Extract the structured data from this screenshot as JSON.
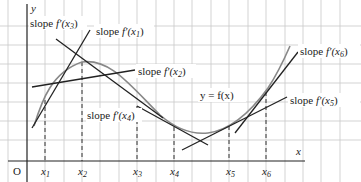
{
  "diagram": {
    "type": "tangent-slopes-of-curve",
    "axes": {
      "x_label": "x",
      "y_label": "y",
      "origin_label": "O"
    },
    "curve_label": "y = f(x)",
    "points": [
      {
        "id": "x1",
        "label_base": "x",
        "label_sub": "1"
      },
      {
        "id": "x2",
        "label_base": "x",
        "label_sub": "2"
      },
      {
        "id": "x3",
        "label_base": "x",
        "label_sub": "3"
      },
      {
        "id": "x4",
        "label_base": "x",
        "label_sub": "4"
      },
      {
        "id": "x5",
        "label_base": "x",
        "label_sub": "5"
      },
      {
        "id": "x6",
        "label_base": "x",
        "label_sub": "6"
      }
    ],
    "tangent_labels": {
      "x1": {
        "prefix": "slope ",
        "func": "f′(x",
        "sub": "1",
        "suffix": ")"
      },
      "x2": {
        "prefix": "slope ",
        "func": "f′(x",
        "sub": "2",
        "suffix": ")"
      },
      "x3": {
        "prefix": "slope ",
        "func": "f′(x",
        "sub": "3",
        "suffix": ")"
      },
      "x4": {
        "prefix": "slope ",
        "func": "f′(x",
        "sub": "4",
        "suffix": ")"
      },
      "x5": {
        "prefix": "slope ",
        "func": "f′(x",
        "sub": "5",
        "suffix": ")"
      },
      "x6": {
        "prefix": "slope ",
        "func": "f′(x",
        "sub": "6",
        "suffix": ")"
      }
    },
    "colors": {
      "grid": "#c8c8c8",
      "axis": "#222222",
      "curve": "#888888",
      "tangent": "#222222",
      "dashed": "#333333"
    }
  }
}
